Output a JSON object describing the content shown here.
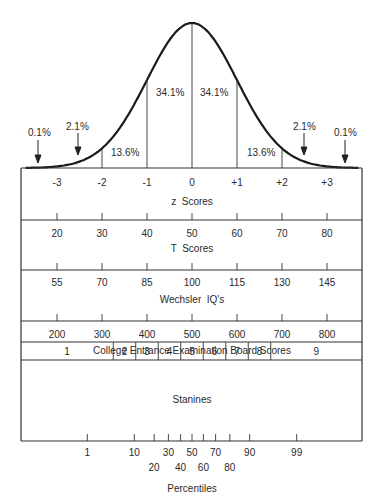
{
  "chart_data": {
    "type": "line",
    "curve": {
      "distribution": "normal",
      "mean": 0,
      "sd": 1,
      "x_range": [
        -3.7,
        3.7
      ]
    },
    "region_percentages": [
      {
        "label": "0.1%",
        "from": "-inf",
        "to": -3,
        "arrow": true
      },
      {
        "label": "2.1%",
        "from": -3,
        "to": -2,
        "arrow": true
      },
      {
        "label": "13.6%",
        "from": -2,
        "to": -1
      },
      {
        "label": "34.1%",
        "from": -1,
        "to": 0
      },
      {
        "label": "34.1%",
        "from": 0,
        "to": 1
      },
      {
        "label": "13.6%",
        "from": 1,
        "to": 2
      },
      {
        "label": "2.1%",
        "from": 2,
        "to": 3,
        "arrow": true
      },
      {
        "label": "0.1%",
        "from": 3,
        "to": "inf",
        "arrow": true
      }
    ],
    "scales": [
      {
        "name": "z Scores",
        "ticks": [
          "-3",
          "-2",
          "-1",
          "0",
          "+1",
          "+2",
          "+3"
        ],
        "z": [
          -3,
          -2,
          -1,
          0,
          1,
          2,
          3
        ]
      },
      {
        "name": "T Scores",
        "ticks": [
          "20",
          "30",
          "40",
          "50",
          "60",
          "70",
          "80"
        ],
        "z": [
          -3,
          -2,
          -1,
          0,
          1,
          2,
          3
        ]
      },
      {
        "name": "Wechsler IQ's",
        "ticks": [
          "55",
          "70",
          "85",
          "100",
          "115",
          "130",
          "145"
        ],
        "z": [
          -3,
          -2,
          -1,
          0,
          1,
          2,
          3
        ]
      },
      {
        "name": "College Entrance Examination Board Scores",
        "ticks": [
          "200",
          "300",
          "400",
          "500",
          "600",
          "700",
          "800"
        ],
        "z": [
          -3,
          -2,
          -1,
          0,
          1,
          2,
          3
        ]
      }
    ],
    "stanines": {
      "name": "Stanines",
      "values": [
        "1",
        "2",
        "3",
        "4",
        "5",
        "6",
        "7",
        "8",
        "9"
      ],
      "boundaries_z": [
        -1.75,
        -1.25,
        -0.75,
        -0.25,
        0.25,
        0.75,
        1.25,
        1.75
      ]
    },
    "percentiles": {
      "name": "Percentiles",
      "upper_row": [
        "1",
        "10",
        "30",
        "50",
        "70",
        "90",
        "99"
      ],
      "lower_row": [
        "20",
        "40",
        "60",
        "80"
      ],
      "ticks": [
        1,
        10,
        20,
        30,
        40,
        50,
        60,
        70,
        80,
        90,
        99
      ]
    },
    "xlabel": "",
    "ylabel": "",
    "grid": false,
    "legend": "none"
  },
  "labels": {
    "pct": [
      "0.1%",
      "2.1%",
      "13.6%",
      "34.1%",
      "34.1%",
      "13.6%",
      "2.1%",
      "0.1%"
    ],
    "z": [
      "-3",
      "-2",
      "-1",
      "0",
      "+1",
      "+2",
      "+3"
    ],
    "z_title": "z  Scores",
    "t": [
      "20",
      "30",
      "40",
      "50",
      "60",
      "70",
      "80"
    ],
    "t_title": "T  Scores",
    "iq": [
      "55",
      "70",
      "85",
      "100",
      "115",
      "130",
      "145"
    ],
    "iq_title": "Wechsler  IQ's",
    "ceeb": [
      "200",
      "300",
      "400",
      "500",
      "600",
      "700",
      "800"
    ],
    "ceeb_title": "College Entrance Examination Board Scores",
    "stanine": [
      "1",
      "2",
      "3",
      "4",
      "5",
      "6",
      "7",
      "8",
      "9"
    ],
    "stanine_title": "Stanines",
    "pctl_upper": [
      "1",
      "10",
      "30",
      "50",
      "70",
      "90",
      "99"
    ],
    "pctl_lower": [
      "20",
      "40",
      "60",
      "80"
    ],
    "pctl_title": "Percentiles"
  }
}
